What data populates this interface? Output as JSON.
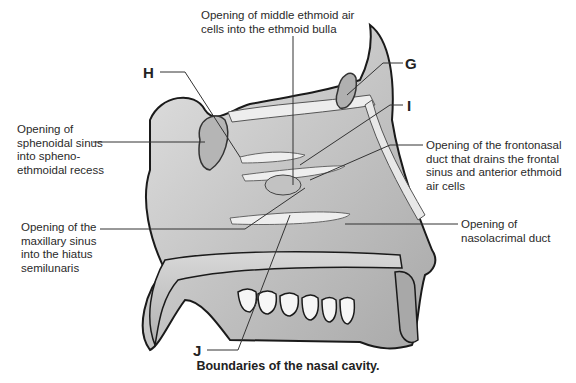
{
  "figure": {
    "title": "Boundaries of the nasal cavity.",
    "letters": {
      "G": "G",
      "H": "H",
      "I": "I",
      "J": "J"
    },
    "labels": {
      "middle_ethmoid": "Opening of middle ethmoid air\ncells into the ethmoid bulla",
      "sphenoidal": "Opening of\nsphenoidal sinus\ninto spheno-\nethmoidal recess",
      "frontonasal": "Opening of the frontonasal\nduct that drains the frontal\nsinus and anterior ethmoid\nair cells",
      "maxillary": "Opening of the\nmaxillary sinus\ninto the hiatus\nsemilunaris",
      "nasolacrimal": "Opening of\nnasolacrimal duct"
    },
    "colors": {
      "outline": "#1a1a1a",
      "tissue": "#c9c9c9",
      "tissue_dark": "#9a9a9a",
      "bone_light": "#e6e6e6",
      "leader": "#333333"
    }
  }
}
